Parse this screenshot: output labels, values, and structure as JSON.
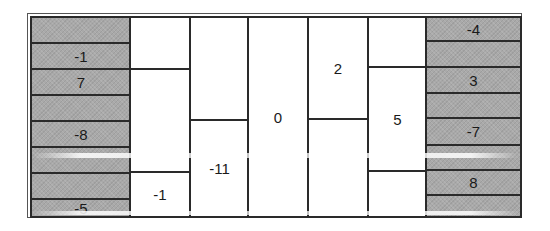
{
  "diagram": {
    "colors": {
      "gray": "#a9a9a9",
      "line": "#2a2a2a",
      "white": "#ffffff",
      "text": "#1a1a1a"
    },
    "columns": [
      {
        "id": "c1",
        "shaded": true,
        "cells": [
          {
            "label": ""
          },
          {
            "label": "-1"
          },
          {
            "label": "7"
          },
          {
            "label": ""
          },
          {
            "label": "-8"
          },
          {
            "label": ""
          },
          {
            "label": ""
          },
          {
            "label": "-5"
          }
        ]
      },
      {
        "id": "c2",
        "shaded": false,
        "cells": [
          {
            "label": ""
          },
          {
            "label": ""
          },
          {
            "label": "-1"
          }
        ]
      },
      {
        "id": "c3",
        "shaded": false,
        "cells": [
          {
            "label": ""
          },
          {
            "label": "-11"
          }
        ]
      },
      {
        "id": "c4",
        "shaded": false,
        "cells": [
          {
            "label": "0"
          }
        ]
      },
      {
        "id": "c5",
        "shaded": false,
        "cells": [
          {
            "label": "2"
          },
          {
            "label": ""
          }
        ]
      },
      {
        "id": "c6",
        "shaded": false,
        "cells": [
          {
            "label": ""
          },
          {
            "label": "5"
          },
          {
            "label": ""
          }
        ]
      },
      {
        "id": "c7",
        "shaded": true,
        "cells": [
          {
            "label": "-4"
          },
          {
            "label": ""
          },
          {
            "label": "3"
          },
          {
            "label": ""
          },
          {
            "label": "-7"
          },
          {
            "label": ""
          },
          {
            "label": "8"
          },
          {
            "label": ""
          }
        ]
      }
    ]
  }
}
